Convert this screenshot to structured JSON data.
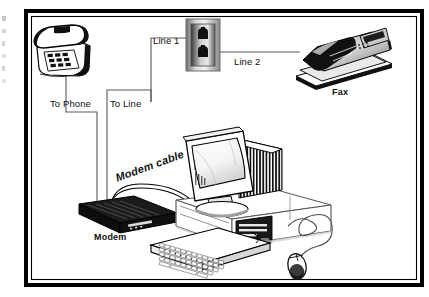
{
  "figure": {
    "type": "wiring-diagram",
    "frame_color": "#000000",
    "background_color": "#ffffff"
  },
  "labels": {
    "line1": "Line 1",
    "line2": "Line 2",
    "to_phone": "To  Phone",
    "to_line": "To Line",
    "fax": "Fax",
    "modem": "Modem",
    "modem_cable": "Modem cable"
  },
  "devices": [
    {
      "id": "telephone",
      "name": "desk-telephone",
      "label": ""
    },
    {
      "id": "wall-jack",
      "name": "wall-phone-jack",
      "label": ""
    },
    {
      "id": "fax",
      "name": "fax-machine",
      "label": "Fax"
    },
    {
      "id": "modem",
      "name": "external-modem",
      "label": "Modem"
    },
    {
      "id": "monitor",
      "name": "crt-monitor",
      "label": ""
    },
    {
      "id": "pc-case",
      "name": "desktop-pc-case",
      "label": ""
    },
    {
      "id": "keyboard",
      "name": "keyboard",
      "label": ""
    },
    {
      "id": "mouse",
      "name": "mouse",
      "label": ""
    }
  ],
  "connections": [
    {
      "from": "wall-jack",
      "to": "modem",
      "label": "Line 1"
    },
    {
      "from": "wall-jack",
      "to": "fax",
      "label": "Line 2"
    },
    {
      "from": "telephone",
      "to": "modem",
      "label": "To  Phone"
    },
    {
      "from": "wall-jack",
      "to": "modem",
      "label": "To Line"
    },
    {
      "from": "modem",
      "to": "pc-case",
      "label": "Modem cable"
    }
  ]
}
